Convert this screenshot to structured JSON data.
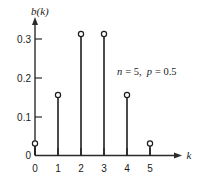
{
  "chart_data": {
    "type": "scatter",
    "title": "",
    "subtitle": "",
    "xlabel": "k",
    "ylabel": "b(k)",
    "categories": [
      "0",
      "1",
      "2",
      "3",
      "4",
      "5"
    ],
    "x": [
      0,
      1,
      2,
      3,
      4,
      5
    ],
    "values": [
      0.031,
      0.156,
      0.313,
      0.313,
      0.156,
      0.031
    ],
    "series": [
      {
        "name": "b(k)",
        "values": [
          0.031,
          0.156,
          0.313,
          0.313,
          0.156,
          0.031
        ]
      }
    ],
    "xlim": [
      0,
      5
    ],
    "ylim": [
      0,
      0.35
    ],
    "xticks": [
      "0",
      "1",
      "2",
      "3",
      "4",
      "5"
    ],
    "yticks": [
      "0",
      "0.1",
      "0.2",
      "0.3"
    ],
    "ytick_values": [
      0,
      0.1,
      0.2,
      0.3
    ],
    "grid": false,
    "legend": false,
    "annotations": [
      {
        "text": "n = 5, p = 0.5",
        "n_symbol": "n",
        "n_value": "= 5,",
        "p_symbol": "p",
        "p_value": "= 0.5"
      }
    ],
    "marker_style": "open-circle",
    "stem_plot": true,
    "colors": {
      "axis": "#2b2b2b",
      "stem": "#1d1d1d",
      "marker_fill": "#ffffff",
      "marker_edge": "#1d1d1d",
      "text": "#1a1a1a",
      "background": "#ffffff"
    }
  },
  "axes": {
    "y_axis_label": "b(k)",
    "x_axis_label": "k"
  }
}
